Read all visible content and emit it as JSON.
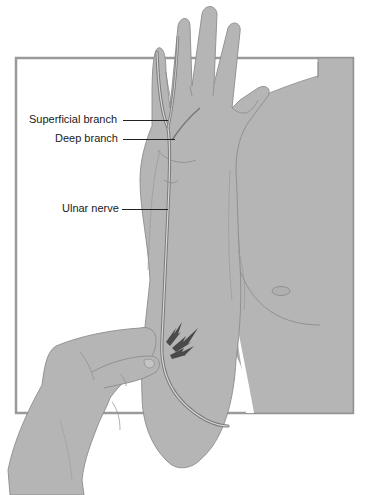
{
  "figure": {
    "colors": {
      "background": "#ffffff",
      "frame": "#9a9a9a",
      "skin": "#b5b5b5",
      "skin_outline": "#8c8c8c",
      "nerve": "#7a7a7a",
      "nerve_core": "#d8d8d8",
      "lightning": "#4a4a4a",
      "label_text": "#1a1a1a"
    },
    "labels": [
      {
        "id": "superficial-branch",
        "text": "Superficial branch"
      },
      {
        "id": "deep-branch",
        "text": "Deep branch"
      },
      {
        "id": "ulnar-nerve",
        "text": "Ulnar nerve"
      }
    ],
    "icons": {
      "shock": "lightning-bolt-icon"
    }
  }
}
